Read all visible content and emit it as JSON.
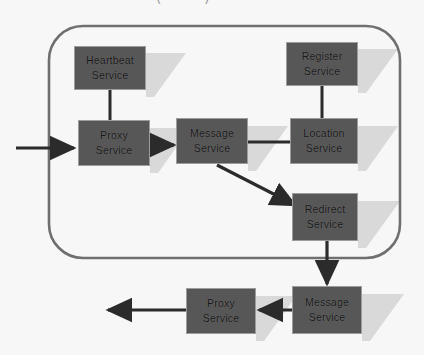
{
  "image": {
    "width": 424,
    "height": 355,
    "background": "#f7f7f7",
    "clipped_header_text": "—— ———————— (———)"
  },
  "diagram": {
    "type": "block-architecture-diagram",
    "container": {
      "name": "service-boundary",
      "shape": "rounded-rectangle",
      "stroke": "#6f6f6f",
      "fill": "none"
    },
    "style": {
      "node_fill": "#575757",
      "node_border": "#9c9c9c",
      "node_text": "#171717",
      "arrow_color": "#2b2b2b",
      "shadow_color": "#d6d6d6"
    },
    "nodes": [
      {
        "id": "heartbeat",
        "line1": "Heartbeat",
        "line2": "Service",
        "x": 74,
        "y": 46,
        "w": 72,
        "h": 44,
        "inside_container": true
      },
      {
        "id": "register",
        "line1": "Register",
        "line2": "Service",
        "x": 286,
        "y": 42,
        "w": 72,
        "h": 44,
        "inside_container": true
      },
      {
        "id": "proxy-top",
        "line1": "Proxy",
        "line2": "Service",
        "x": 78,
        "y": 120,
        "w": 72,
        "h": 46,
        "inside_container": true
      },
      {
        "id": "message-top",
        "line1": "Message",
        "line2": "Service",
        "x": 176,
        "y": 118,
        "w": 72,
        "h": 46,
        "inside_container": true
      },
      {
        "id": "location",
        "line1": "Location",
        "line2": "Service",
        "x": 290,
        "y": 118,
        "w": 68,
        "h": 46,
        "inside_container": true
      },
      {
        "id": "redirect",
        "line1": "Redirect",
        "line2": "Service",
        "x": 292,
        "y": 193,
        "w": 66,
        "h": 48,
        "inside_container": true
      },
      {
        "id": "proxy-bottom",
        "line1": "Proxy",
        "line2": "Service",
        "x": 186,
        "y": 288,
        "w": 70,
        "h": 46,
        "inside_container": false
      },
      {
        "id": "message-bottom",
        "line1": "Message",
        "line2": "Service",
        "x": 292,
        "y": 286,
        "w": 70,
        "h": 48,
        "inside_container": false
      }
    ],
    "edges": [
      {
        "id": "external-in-to-proxy",
        "from": "external",
        "to": "proxy-top",
        "kind": "arrow",
        "direction": "right"
      },
      {
        "id": "heartbeat-to-proxy",
        "from": "heartbeat",
        "to": "proxy-top",
        "kind": "plain-line",
        "direction": "down"
      },
      {
        "id": "proxy-to-message",
        "from": "proxy-top",
        "to": "message-top",
        "kind": "arrow",
        "direction": "right"
      },
      {
        "id": "message-to-location",
        "from": "message-top",
        "to": "location",
        "kind": "plain-line",
        "direction": "right"
      },
      {
        "id": "register-to-location",
        "from": "register",
        "to": "location",
        "kind": "plain-line",
        "direction": "down"
      },
      {
        "id": "message-to-redirect",
        "from": "message-top",
        "to": "redirect",
        "kind": "arrow",
        "direction": "diagonal-down-right"
      },
      {
        "id": "redirect-to-message-bottom",
        "from": "redirect",
        "to": "message-bottom",
        "kind": "arrow",
        "direction": "down"
      },
      {
        "id": "message-bottom-to-proxy",
        "from": "message-bottom",
        "to": "proxy-bottom",
        "kind": "arrow",
        "direction": "left"
      },
      {
        "id": "proxy-bottom-to-external",
        "from": "proxy-bottom",
        "to": "external",
        "kind": "arrow",
        "direction": "left"
      }
    ]
  }
}
